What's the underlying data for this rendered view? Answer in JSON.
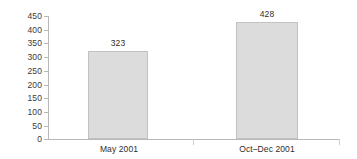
{
  "chart_data": {
    "type": "bar",
    "title": "",
    "subtitle": "",
    "xlabel": "",
    "ylabel": "",
    "categories": [
      "May 2001",
      "Oct–Dec 2001"
    ],
    "values": [
      323,
      428
    ],
    "value_labels": [
      "323",
      "428"
    ],
    "ylim": [
      0,
      450
    ],
    "ytick_step": 50,
    "yticks": [
      0,
      50,
      100,
      150,
      200,
      250,
      300,
      350,
      400,
      450
    ],
    "ytick_labels": [
      "0",
      "50",
      "100",
      "150",
      "200",
      "250",
      "300",
      "350",
      "400",
      "450"
    ],
    "grid": false,
    "legend": false,
    "legend_position": "none",
    "series": [
      {
        "name": "",
        "values": [
          323,
          428
        ]
      }
    ]
  },
  "style": {
    "bar_fill": "#dcdcdc",
    "bar_border": "#c2c2c2",
    "axis_color": "#b8b8b8",
    "text_color": "#2e2e2e",
    "background": "#ffffff"
  }
}
